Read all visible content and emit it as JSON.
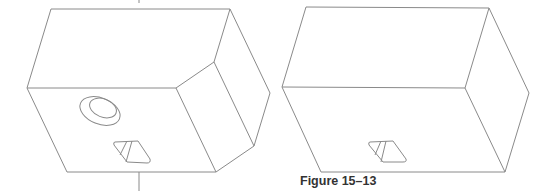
{
  "figure": {
    "caption": "Figure 15–13",
    "line_color": "#8a8a8a",
    "views": [
      {
        "name": "chamfered-block-with-hole",
        "features": [
          "chamfered-corner",
          "counterbored-hole",
          "rectangular-slot",
          "centerline"
        ]
      },
      {
        "name": "rectangular-block",
        "features": [
          "rectangular-slot"
        ]
      }
    ]
  }
}
